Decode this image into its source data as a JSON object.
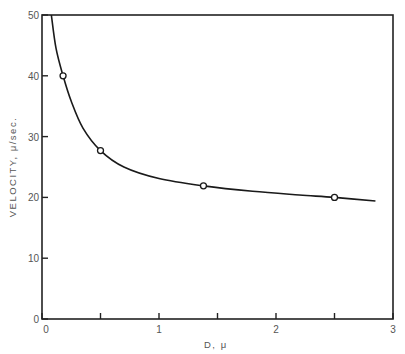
{
  "chart_data": {
    "type": "line",
    "title": "",
    "xlabel": "D, μ",
    "ylabel": "VELOCITY, μ/sec.",
    "xlim": [
      0,
      3
    ],
    "ylim": [
      0,
      50
    ],
    "x_ticks": [
      0,
      0.5,
      1,
      1.5,
      2,
      2.5,
      3
    ],
    "x_tick_labels": [
      "0",
      "",
      "1",
      "",
      "2",
      "",
      "3"
    ],
    "y_ticks": [
      0,
      10,
      20,
      30,
      40,
      50
    ],
    "y_tick_labels": [
      "0",
      "10",
      "20",
      "30",
      "40",
      "50"
    ],
    "grid": false,
    "legend": "none",
    "series": [
      {
        "name": "measured",
        "style": "open-circle-markers",
        "x": [
          0.18,
          0.5,
          1.38,
          2.5
        ],
        "y": [
          40,
          27.7,
          21.9,
          20
        ]
      },
      {
        "name": "fitted curve",
        "style": "smooth-line",
        "x": [
          0.08,
          0.12,
          0.18,
          0.25,
          0.35,
          0.5,
          0.7,
          1.0,
          1.38,
          1.8,
          2.2,
          2.5,
          2.85
        ],
        "y": [
          50,
          44.5,
          40,
          35.8,
          31.4,
          27.7,
          25.0,
          23.1,
          21.9,
          21.0,
          20.4,
          20.0,
          19.4
        ]
      }
    ]
  }
}
